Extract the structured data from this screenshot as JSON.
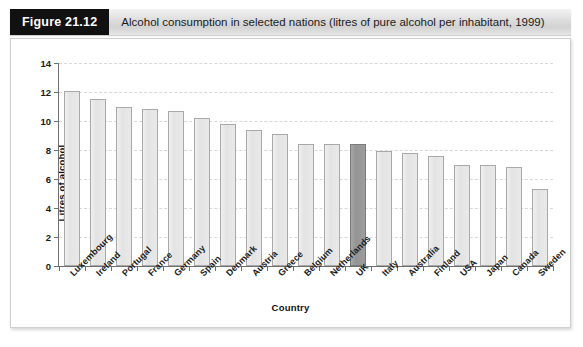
{
  "header": {
    "figure_number": "Figure 21.12",
    "caption": "Alcohol consumption in selected nations (litres of pure alcohol per inhabitant, 1999)"
  },
  "colors": {
    "bar_fill": "#e7e7e7",
    "bar_border": "#a8a8a8",
    "highlight_fill": "#999999",
    "highlight_border": "#7a7a7a",
    "axis": "#6f6f6f",
    "gridline": "#d8d8d8",
    "header_box": "#111111",
    "header_band": "#dcdcdc"
  },
  "chart_data": {
    "type": "bar",
    "title": "Alcohol consumption in selected nations (litres of pure alcohol per inhabitant, 1999)",
    "xlabel": "Country",
    "ylabel": "Litres of alcohol",
    "ylim": [
      0,
      14
    ],
    "yticks": [
      0,
      2,
      4,
      6,
      8,
      10,
      12,
      14
    ],
    "grid": true,
    "legend": "none",
    "highlight_category": "UK",
    "categories": [
      "Luxembourg",
      "Ireland",
      "Portugal",
      "France",
      "Germany",
      "Spain",
      "Denmark",
      "Austria",
      "Greece",
      "Belgium",
      "Netherlands",
      "UK",
      "Italy",
      "Australia",
      "Finland",
      "USA",
      "Japan",
      "Canada",
      "Sweden"
    ],
    "values": [
      12.1,
      11.5,
      11.0,
      10.8,
      10.7,
      10.2,
      9.8,
      9.4,
      9.1,
      8.4,
      8.4,
      8.4,
      7.9,
      7.8,
      7.6,
      7.0,
      7.0,
      6.8,
      5.3
    ]
  }
}
